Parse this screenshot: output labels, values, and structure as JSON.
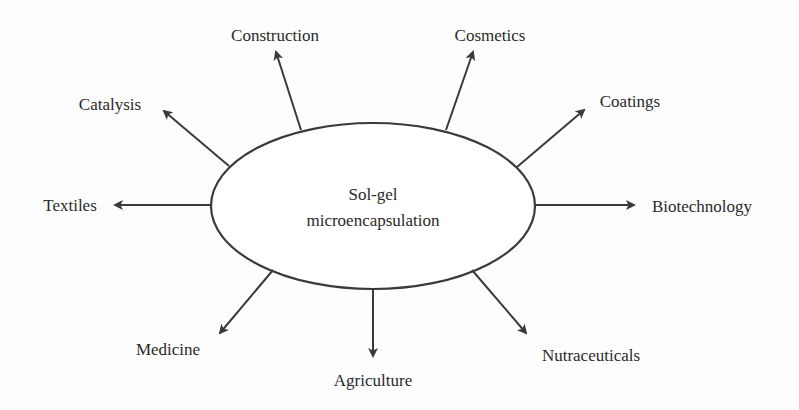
{
  "diagram": {
    "center": {
      "line1": "Sol-gel",
      "line2": "microencapsulation"
    },
    "applications": [
      {
        "id": "construction",
        "label": "Construction"
      },
      {
        "id": "cosmetics",
        "label": "Cosmetics"
      },
      {
        "id": "catalysis",
        "label": "Catalysis"
      },
      {
        "id": "coatings",
        "label": "Coatings"
      },
      {
        "id": "textiles",
        "label": "Textiles"
      },
      {
        "id": "biotechnology",
        "label": "Biotechnology"
      },
      {
        "id": "medicine",
        "label": "Medicine"
      },
      {
        "id": "agriculture",
        "label": "Agriculture"
      },
      {
        "id": "nutraceuticals",
        "label": "Nutraceuticals"
      }
    ],
    "colors": {
      "stroke": "#3a3a3a",
      "text": "#2a2a2a",
      "background": "#fdfdfd"
    }
  }
}
